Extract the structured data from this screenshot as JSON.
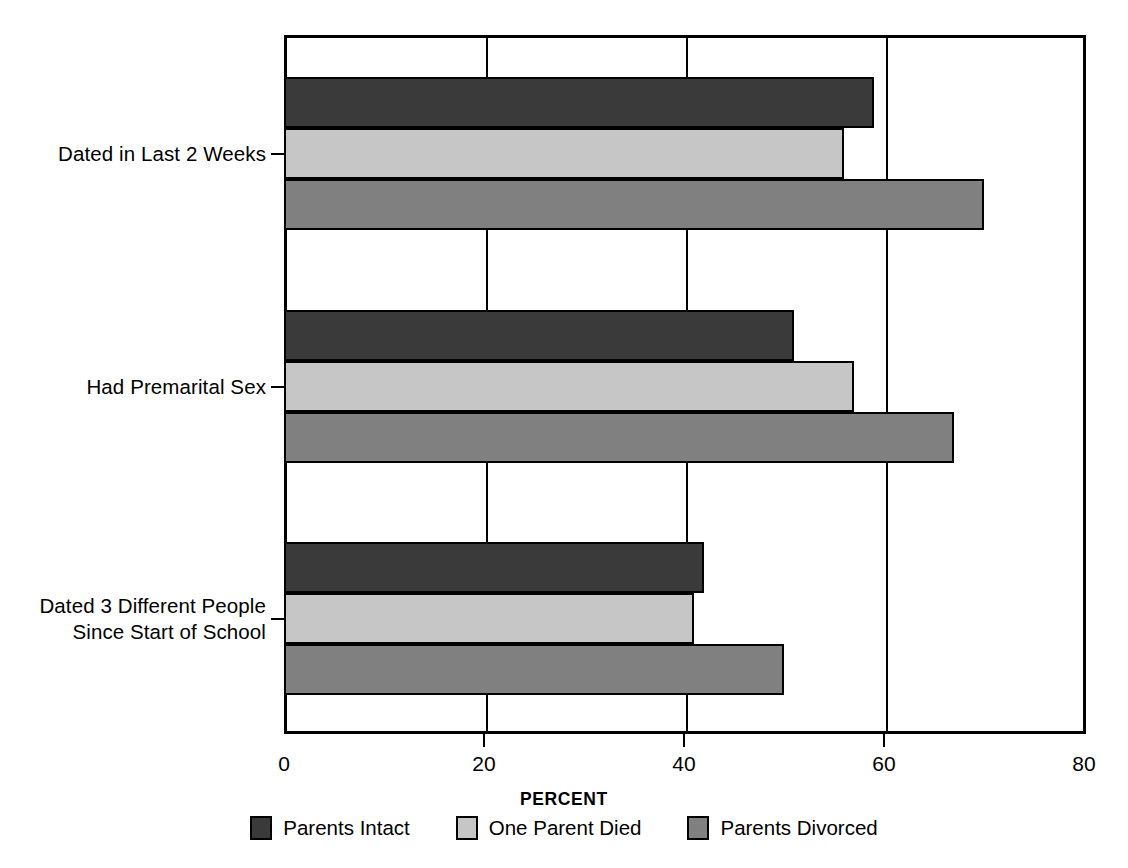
{
  "chart_data": {
    "type": "bar",
    "orientation": "horizontal",
    "title": "",
    "xlabel": "PERCENT",
    "ylabel": "",
    "xlim": [
      0,
      80
    ],
    "xticks": [
      0,
      20,
      40,
      60,
      80
    ],
    "xtick_labels": [
      "0",
      "20",
      "40",
      "60",
      "80"
    ],
    "grid": true,
    "grid_axis": "x",
    "legend_position": "bottom",
    "categories": [
      "Dated in Last 2 Weeks",
      "Had Premarital Sex",
      "Dated 3 Different People\nSince Start of School"
    ],
    "series": [
      {
        "name": "Parents Intact",
        "color": "#3a3a3a",
        "values": [
          59,
          51,
          42
        ]
      },
      {
        "name": "One Parent Died",
        "color": "#c6c6c6",
        "values": [
          56,
          57,
          41
        ]
      },
      {
        "name": "Parents Divorced",
        "color": "#808080",
        "values": [
          70,
          67,
          50
        ]
      }
    ]
  },
  "axis": {
    "x_title": "PERCENT",
    "tick_labels": [
      "0",
      "20",
      "40",
      "60",
      "80"
    ]
  },
  "legend": {
    "items": [
      {
        "label": "Parents Intact"
      },
      {
        "label": "One Parent Died"
      },
      {
        "label": "Parents Divorced"
      }
    ]
  },
  "categories": [
    {
      "label": "Dated in Last 2 Weeks"
    },
    {
      "label": "Had Premarital Sex"
    },
    {
      "label": "Dated 3 Different People\nSince Start of School"
    }
  ]
}
